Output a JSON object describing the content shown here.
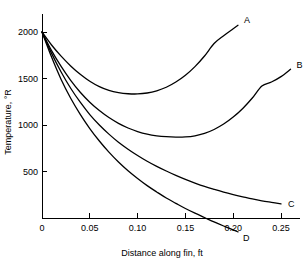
{
  "chart_data": {
    "type": "line",
    "title": "",
    "xlabel": "Distance along fin, ft",
    "ylabel": "Temperature, °R",
    "xlim": [
      0,
      0.27
    ],
    "ylim": [
      0,
      2100
    ],
    "grid": false,
    "legend": "curve-end-labels",
    "xticks": [
      0,
      0.05,
      0.1,
      0.15,
      0.2,
      0.25
    ],
    "xticklabels": [
      "0",
      "0.05",
      "0.10",
      "0.15",
      "0.20",
      "0.25"
    ],
    "yticks": [
      500,
      1000,
      1500,
      2000
    ],
    "yticklabels": [
      "500",
      "1000",
      "1500",
      "2000"
    ],
    "series": [
      {
        "name": "A",
        "label": "A",
        "points": [
          [
            0.0,
            2000
          ],
          [
            0.01,
            1860
          ],
          [
            0.02,
            1740
          ],
          [
            0.03,
            1635
          ],
          [
            0.04,
            1545
          ],
          [
            0.05,
            1470
          ],
          [
            0.06,
            1412
          ],
          [
            0.07,
            1372
          ],
          [
            0.08,
            1348
          ],
          [
            0.09,
            1336
          ],
          [
            0.1,
            1334
          ],
          [
            0.11,
            1344
          ],
          [
            0.12,
            1368
          ],
          [
            0.13,
            1406
          ],
          [
            0.14,
            1462
          ],
          [
            0.15,
            1535
          ],
          [
            0.16,
            1628
          ],
          [
            0.17,
            1742
          ],
          [
            0.18,
            1876
          ],
          [
            0.19,
            1960
          ],
          [
            0.2,
            2035
          ],
          [
            0.205,
            2072
          ]
        ]
      },
      {
        "name": "B",
        "label": "B",
        "points": [
          [
            0.0,
            2000
          ],
          [
            0.01,
            1800
          ],
          [
            0.02,
            1630
          ],
          [
            0.03,
            1480
          ],
          [
            0.04,
            1352
          ],
          [
            0.05,
            1245
          ],
          [
            0.06,
            1155
          ],
          [
            0.07,
            1080
          ],
          [
            0.08,
            1018
          ],
          [
            0.09,
            968
          ],
          [
            0.1,
            930
          ],
          [
            0.11,
            902
          ],
          [
            0.12,
            884
          ],
          [
            0.13,
            874
          ],
          [
            0.14,
            870
          ],
          [
            0.15,
            872
          ],
          [
            0.16,
            884
          ],
          [
            0.17,
            910
          ],
          [
            0.18,
            952
          ],
          [
            0.19,
            1010
          ],
          [
            0.2,
            1085
          ],
          [
            0.21,
            1178
          ],
          [
            0.22,
            1290
          ],
          [
            0.23,
            1420
          ],
          [
            0.24,
            1462
          ],
          [
            0.25,
            1520
          ],
          [
            0.26,
            1600
          ]
        ]
      },
      {
        "name": "C",
        "label": "C",
        "points": [
          [
            0.0,
            2000
          ],
          [
            0.01,
            1770
          ],
          [
            0.02,
            1570
          ],
          [
            0.03,
            1395
          ],
          [
            0.04,
            1245
          ],
          [
            0.05,
            1112
          ],
          [
            0.06,
            1000
          ],
          [
            0.07,
            902
          ],
          [
            0.08,
            815
          ],
          [
            0.09,
            740
          ],
          [
            0.1,
            672
          ],
          [
            0.11,
            610
          ],
          [
            0.12,
            555
          ],
          [
            0.13,
            505
          ],
          [
            0.14,
            458
          ],
          [
            0.15,
            415
          ],
          [
            0.16,
            376
          ],
          [
            0.17,
            340
          ],
          [
            0.18,
            308
          ],
          [
            0.19,
            278
          ],
          [
            0.2,
            252
          ],
          [
            0.21,
            228
          ],
          [
            0.22,
            205
          ],
          [
            0.23,
            185
          ],
          [
            0.24,
            168
          ],
          [
            0.25,
            152
          ]
        ]
      },
      {
        "name": "D",
        "label": "D",
        "points": [
          [
            0.0,
            2000
          ],
          [
            0.01,
            1730
          ],
          [
            0.02,
            1490
          ],
          [
            0.03,
            1288
          ],
          [
            0.04,
            1115
          ],
          [
            0.05,
            962
          ],
          [
            0.06,
            828
          ],
          [
            0.07,
            708
          ],
          [
            0.08,
            602
          ],
          [
            0.09,
            508
          ],
          [
            0.1,
            425
          ],
          [
            0.11,
            348
          ],
          [
            0.12,
            280
          ],
          [
            0.13,
            215
          ],
          [
            0.14,
            158
          ],
          [
            0.15,
            102
          ],
          [
            0.16,
            52
          ],
          [
            0.17,
            5
          ],
          [
            0.18,
            -42
          ],
          [
            0.19,
            -86
          ],
          [
            0.2,
            -128
          ],
          [
            0.205,
            -150
          ]
        ]
      }
    ]
  }
}
